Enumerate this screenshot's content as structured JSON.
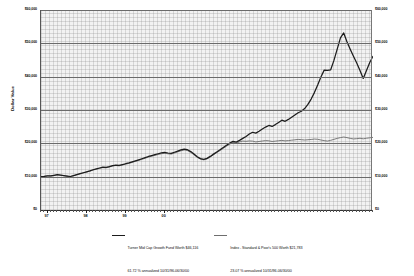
{
  "chart_data": {
    "type": "line",
    "title": "",
    "xlabel": "",
    "ylabel": "Dollar Value",
    "ylim": [
      0,
      60000
    ],
    "grid": true,
    "legend_position": "bottom",
    "y_ticks": [
      "$0",
      "$10,000",
      "$20,000",
      "$30,000",
      "$40,000",
      "$50,000",
      "$60,000"
    ],
    "y_tick_values": [
      0,
      10000,
      20000,
      30000,
      40000,
      50000,
      60000
    ],
    "x_tick_labels": [
      "97",
      "98",
      "99",
      "00"
    ],
    "x_range_start": "10/31/96",
    "x_range_end": "06/30/00",
    "series": [
      {
        "name": "Turner Mid Cap Growth Fund",
        "color": "#1c1c1c",
        "final_value": 46116,
        "annualized_return": "61.72 %",
        "values": [
          10000,
          10080,
          10260,
          10210,
          10420,
          10600,
          10480,
          10320,
          10180,
          10050,
          10320,
          10610,
          10900,
          11180,
          11460,
          11720,
          12080,
          12340,
          12600,
          12830,
          12760,
          13010,
          13320,
          13480,
          13360,
          13610,
          13880,
          14120,
          14430,
          14760,
          15060,
          15380,
          15720,
          16060,
          16340,
          16620,
          16880,
          17120,
          17260,
          17100,
          16980,
          17320,
          17680,
          18020,
          18260,
          18080,
          17520,
          16780,
          15960,
          15420,
          15180,
          15480,
          16080,
          16760,
          17420,
          18060,
          18740,
          19420,
          20060,
          20620,
          20380,
          20880,
          21480,
          22060,
          22780,
          23320,
          23060,
          23620,
          24280,
          24880,
          25360,
          25060,
          25620,
          26280,
          26940,
          26600,
          27180,
          27840,
          28520,
          29180,
          29620,
          30420,
          31680,
          33280,
          35220,
          37480,
          39880,
          41960,
          41880,
          42060,
          44880,
          48260,
          51620,
          53120,
          50480,
          48260,
          46120,
          44080,
          41880,
          39480,
          41820,
          44260,
          46116
        ]
      },
      {
        "name": "Index - Standard & Poor's 500",
        "color": "#6e6e6e",
        "final_value": 21783,
        "annualized_return": "23.07 %",
        "values": [
          10000,
          10090,
          10230,
          10180,
          10360,
          10520,
          10440,
          10300,
          10160,
          10020,
          10280,
          10560,
          10840,
          11120,
          11390,
          11640,
          11980,
          12240,
          12490,
          12720,
          12660,
          12900,
          13190,
          13350,
          13240,
          13490,
          13750,
          13980,
          14280,
          14600,
          14890,
          15200,
          15530,
          15860,
          16130,
          16400,
          16650,
          16880,
          17020,
          16870,
          16760,
          17090,
          17440,
          17770,
          18000,
          17830,
          17290,
          16570,
          15790,
          15260,
          15030,
          15320,
          15900,
          16560,
          17200,
          17820,
          18480,
          19140,
          19760,
          20300,
          20070,
          20420,
          20680,
          20600,
          20720,
          20660,
          20420,
          20560,
          20700,
          20820,
          20760,
          20560,
          20660,
          20780,
          20880,
          20740,
          20820,
          20940,
          21060,
          21180,
          21100,
          21000,
          21080,
          21160,
          21280,
          21220,
          21000,
          20820,
          20680,
          20900,
          21200,
          21480,
          21720,
          21900,
          21720,
          21480,
          21320,
          21400,
          21520,
          21360,
          21520,
          21660,
          21783
        ]
      }
    ]
  },
  "axes": {
    "y_title": "Dollar Value",
    "left_labels": [
      "$60,000",
      "$50,000",
      "$40,000",
      "$30,000",
      "$20,000",
      "$10,000",
      "$0"
    ],
    "right_labels": [
      "$60,000",
      "$50,000",
      "$40,000",
      "$30,000",
      "$20,000",
      "$10,000",
      "$0"
    ],
    "x_labels": [
      "97",
      "98",
      "99",
      "00"
    ]
  },
  "legend": {
    "entries": [
      {
        "line1": "Turner Mid Cap Growth Fund Worth $46,116",
        "line2": "61.72 % annualized 10/31/96-06/30/00"
      },
      {
        "line1": "Index - Standard & Poor's 500 Worth $21,783",
        "line2": "23.07 % annualized 10/31/96-06/30/00"
      }
    ]
  }
}
